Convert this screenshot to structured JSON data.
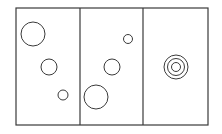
{
  "diagram": {
    "background": "#ffffff",
    "stroke": "#3a3a3a",
    "frame": {
      "x": 16,
      "y": 8,
      "width": 192,
      "height": 117
    },
    "dividers": [
      80,
      143
    ],
    "panels": [
      {
        "name": "panel-1",
        "circles": [
          {
            "cx": 33,
            "cy": 34,
            "r": 12
          },
          {
            "cx": 49,
            "cy": 67,
            "r": 8
          },
          {
            "cx": 63,
            "cy": 95,
            "r": 5
          }
        ]
      },
      {
        "name": "panel-2",
        "circles": [
          {
            "cx": 128,
            "cy": 39,
            "r": 4.5
          },
          {
            "cx": 112,
            "cy": 67,
            "r": 8
          },
          {
            "cx": 96,
            "cy": 97,
            "r": 12
          }
        ]
      },
      {
        "name": "panel-3",
        "circles": [
          {
            "cx": 176,
            "cy": 67,
            "r": 12
          },
          {
            "cx": 176,
            "cy": 67,
            "r": 8.5
          },
          {
            "cx": 176,
            "cy": 67,
            "r": 4.5
          }
        ]
      }
    ]
  }
}
